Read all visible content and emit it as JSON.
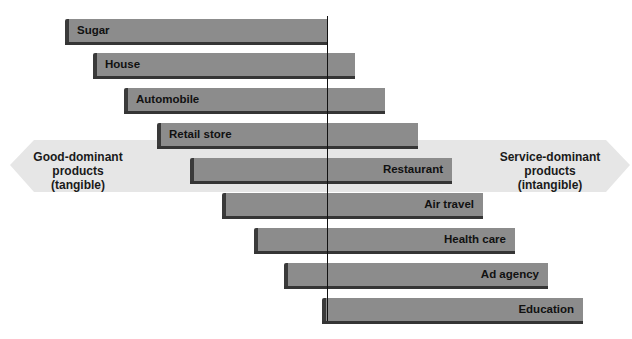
{
  "diagram": {
    "colors": {
      "bar_face": "#8c8c8c",
      "bar_edge": "#3a3a3a",
      "arrow_fill": "#e6e6e6",
      "divider": "#111111"
    },
    "left_pole": {
      "line1": "Good-dominant",
      "line2": "products",
      "line3": "(tangible)"
    },
    "right_pole": {
      "line1": "Service-dominant",
      "line2": "products",
      "line3": "(intangible)"
    },
    "bars": [
      {
        "label": "Sugar",
        "label_side": "left",
        "x": 65,
        "y": 19,
        "width": 262
      },
      {
        "label": "House",
        "label_side": "left",
        "x": 93,
        "y": 53,
        "width": 262
      },
      {
        "label": "Automobile",
        "label_side": "left",
        "x": 124,
        "y": 88,
        "width": 261
      },
      {
        "label": "Retail store",
        "label_side": "left",
        "x": 157,
        "y": 123,
        "width": 261
      },
      {
        "label": "Restaurant",
        "label_side": "right",
        "x": 190,
        "y": 158,
        "width": 262
      },
      {
        "label": "Air travel",
        "label_side": "right",
        "x": 222,
        "y": 193,
        "width": 261
      },
      {
        "label": "Health care",
        "label_side": "right",
        "x": 254,
        "y": 228,
        "width": 261
      },
      {
        "label": "Ad agency",
        "label_side": "right",
        "x": 284,
        "y": 263,
        "width": 264
      },
      {
        "label": "Education",
        "label_side": "right",
        "x": 322,
        "y": 298,
        "width": 261
      }
    ]
  }
}
